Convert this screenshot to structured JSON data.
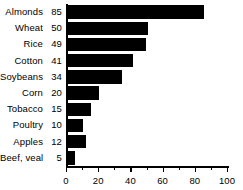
{
  "chart_data": {
    "type": "bar",
    "orientation": "horizontal",
    "title": "",
    "subtitle": "",
    "xlabel": "",
    "ylabel": "",
    "xlim": [
      0,
      100
    ],
    "xticks": [
      0,
      20,
      40,
      60,
      80,
      100
    ],
    "xtick_labels": [
      "0",
      "20",
      "40",
      "60",
      "80",
      "100"
    ],
    "minor_xticks": [
      10,
      30,
      50,
      70,
      90
    ],
    "grid": false,
    "legend": null,
    "bar_color": "#000000",
    "background_color": "#ffffff",
    "categories": [
      "Almonds",
      "Wheat",
      "Rice",
      "Cotton",
      "Soybeans",
      "Corn",
      "Tobacco",
      "Poultry",
      "Apples",
      "Beef, veal"
    ],
    "values": [
      85,
      50,
      49,
      41,
      34,
      20,
      15,
      10,
      12,
      5
    ],
    "value_labels": [
      "85",
      "50",
      "49",
      "41",
      "34",
      "20",
      "15",
      "10",
      "12",
      "5"
    ],
    "rows": [
      {
        "label": "Almonds",
        "value": 85,
        "value_label": "85"
      },
      {
        "label": "Wheat",
        "value": 50,
        "value_label": "50"
      },
      {
        "label": "Rice",
        "value": 49,
        "value_label": "49"
      },
      {
        "label": "Cotton",
        "value": 41,
        "value_label": "41"
      },
      {
        "label": "Soybeans",
        "value": 34,
        "value_label": "34"
      },
      {
        "label": "Corn",
        "value": 20,
        "value_label": "20"
      },
      {
        "label": "Tobacco",
        "value": 15,
        "value_label": "15"
      },
      {
        "label": "Poultry",
        "value": 10,
        "value_label": "10"
      },
      {
        "label": "Apples",
        "value": 12,
        "value_label": "12"
      },
      {
        "label": "Beef, veal",
        "value": 5,
        "value_label": "5"
      }
    ]
  }
}
